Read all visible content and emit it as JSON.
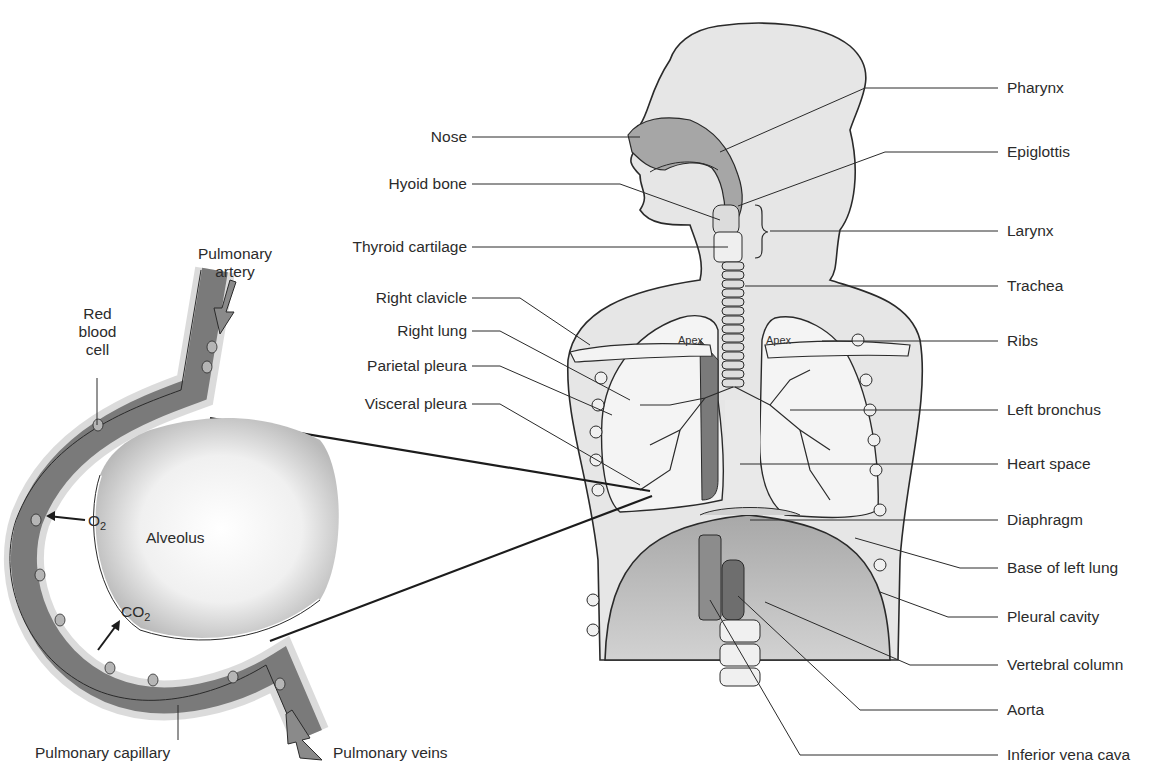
{
  "diagram": {
    "type": "anatomy-respiratory-system",
    "main_figure": {
      "left_labels": [
        {
          "id": "nose",
          "text": "Nose"
        },
        {
          "id": "hyoid-bone",
          "text": "Hyoid bone"
        },
        {
          "id": "thyroid-cartilage",
          "text": "Thyroid cartilage"
        },
        {
          "id": "right-clavicle",
          "text": "Right clavicle"
        },
        {
          "id": "right-lung",
          "text": "Right lung"
        },
        {
          "id": "parietal-pleura",
          "text": "Parietal pleura"
        },
        {
          "id": "visceral-pleura",
          "text": "Visceral pleura"
        }
      ],
      "right_labels": [
        {
          "id": "pharynx",
          "text": "Pharynx"
        },
        {
          "id": "epiglottis",
          "text": "Epiglottis"
        },
        {
          "id": "larynx",
          "text": "Larynx"
        },
        {
          "id": "trachea",
          "text": "Trachea"
        },
        {
          "id": "ribs",
          "text": "Ribs"
        },
        {
          "id": "left-bronchus",
          "text": "Left bronchus"
        },
        {
          "id": "heart-space",
          "text": "Heart space"
        },
        {
          "id": "diaphragm",
          "text": "Diaphragm"
        },
        {
          "id": "base-of-left-lung",
          "text": "Base of left lung"
        },
        {
          "id": "pleural-cavity",
          "text": "Pleural cavity"
        },
        {
          "id": "vertebral-column",
          "text": "Vertebral column"
        },
        {
          "id": "aorta",
          "text": "Aorta"
        },
        {
          "id": "inferior-vena-cava",
          "text": "Inferior vena cava"
        }
      ],
      "inline_labels": {
        "apex_right": "Apex",
        "apex_left": "Apex"
      }
    },
    "inset": {
      "title_labels": {
        "pulmonary_artery_line1": "Pulmonary",
        "pulmonary_artery_line2": "artery",
        "rbc_line1": "Red",
        "rbc_line2": "blood",
        "rbc_line3": "cell",
        "alveolus": "Alveolus",
        "o2": "O",
        "o2_sub": "2",
        "co2": "CO",
        "co2_sub": "2",
        "pulmonary_capillary": "Pulmonary capillary",
        "pulmonary_veins": "Pulmonary veins"
      }
    },
    "colors": {
      "body_fill": "#e6e6e6",
      "outline": "#2a2a2a",
      "lung_fill": "#f4f4f4",
      "dark_tissue": "#7a7a7a",
      "vessel": "#8a8a8a",
      "text": "#2b2b2b"
    }
  }
}
